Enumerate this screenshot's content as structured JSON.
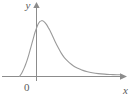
{
  "figure": {
    "background_color": "#ffffff",
    "axis_color": "#8c8c8c",
    "curve_color": "#9a9a9a",
    "label_color": "#5a5a5a",
    "labels": {
      "y_axis": "y",
      "x_axis": "x",
      "origin": "0"
    }
  },
  "chart_data": {
    "type": "line",
    "title": "",
    "subtitle": "",
    "xlabel": "x",
    "ylabel": "y",
    "legend": [],
    "legend_position": "none",
    "grid": false,
    "axis_arrows": {
      "x": true,
      "y": true
    },
    "tick_labels": {
      "x": [
        "0"
      ],
      "y": []
    },
    "xlim": [
      -1.1,
      5.4
    ],
    "ylim": [
      0,
      1.15
    ],
    "series": [
      {
        "name": "density",
        "x": [
          -1.1,
          -1.0,
          -0.9,
          -0.8,
          -0.7,
          -0.6,
          -0.5,
          -0.4,
          -0.3,
          -0.2,
          -0.1,
          0.0,
          0.1,
          0.2,
          0.3,
          0.4,
          0.5,
          0.6,
          0.7,
          0.8,
          0.9,
          1.0,
          1.2,
          1.4,
          1.6,
          1.8,
          2.0,
          2.25,
          2.5,
          2.75,
          3.0,
          3.3,
          3.6,
          4.0,
          4.4,
          4.8,
          5.2,
          5.4
        ],
        "y": [
          0.0,
          0.04,
          0.09,
          0.15,
          0.22,
          0.3,
          0.39,
          0.49,
          0.59,
          0.69,
          0.79,
          0.87,
          0.94,
          0.98,
          1.0,
          1.0,
          0.98,
          0.95,
          0.91,
          0.86,
          0.81,
          0.75,
          0.63,
          0.52,
          0.42,
          0.34,
          0.28,
          0.22,
          0.17,
          0.14,
          0.11,
          0.085,
          0.068,
          0.052,
          0.042,
          0.036,
          0.032,
          0.031
        ]
      }
    ]
  }
}
